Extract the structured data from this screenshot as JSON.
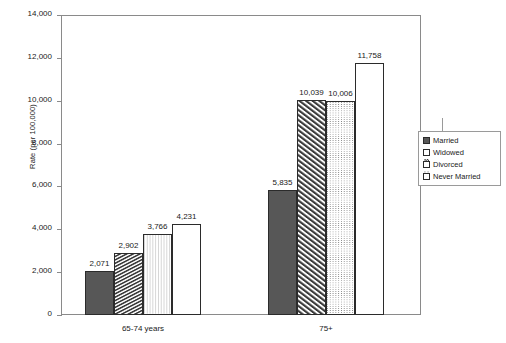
{
  "chart_data": {
    "type": "bar",
    "title": "",
    "subtitle": "",
    "xlabel": "",
    "ylabel": "Rate (per 100,000)",
    "categories": [
      "65-74 years",
      "75+"
    ],
    "series": [
      {
        "name": "Married",
        "pattern": "solid",
        "values": [
          2071,
          5835
        ]
      },
      {
        "name": "Widowed",
        "pattern": "hatch",
        "values": [
          2902,
          10039
        ]
      },
      {
        "name": "Divorced",
        "pattern": "dots",
        "values": [
          3766,
          10006
        ]
      },
      {
        "name": "Never Married",
        "pattern": "plain",
        "values": [
          4231,
          11758
        ]
      }
    ],
    "value_labels": [
      [
        "2,071",
        "2,902",
        "3,766",
        "4,231"
      ],
      [
        "5,835",
        "10,039",
        "10,006",
        "11,758"
      ]
    ],
    "ylim": [
      0,
      14000
    ],
    "ytick_values": [
      0,
      2000,
      4000,
      6000,
      8000,
      10000,
      12000,
      14000
    ],
    "ytick_labels": [
      "0",
      "2,000",
      "4,000",
      "6,000",
      "8,000",
      "10,000",
      "12,000",
      "14,000"
    ],
    "grid": false,
    "legend_position": "right",
    "legend_entries": [
      "Married",
      "Widowed",
      "Divorced",
      "Never Married"
    ],
    "colors": {
      "married": "#575757",
      "widowed": "#ffffff",
      "divorced": "#ffffff",
      "never_married": "#ffffff",
      "outline": "#2b2b2b",
      "axis": "#8a8a8a",
      "text": "#1a1a1a",
      "background": "#ffffff"
    }
  }
}
